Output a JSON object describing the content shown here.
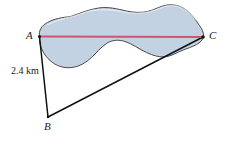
{
  "figure": {
    "type": "geometry-diagram",
    "vertices": [
      {
        "id": "A",
        "label": "A",
        "x": 39,
        "y": 36
      },
      {
        "id": "B",
        "label": "B",
        "x": 48,
        "y": 117
      },
      {
        "id": "C",
        "label": "C",
        "x": 203,
        "y": 37
      }
    ],
    "measurements": [
      {
        "side": "AB",
        "label": "2.4 km",
        "value": 2.4,
        "unit": "km"
      }
    ],
    "colors": {
      "lake_fill": "#c2d2e2",
      "lake_outline": "#4a4a48",
      "measure_line": "#d1546c",
      "triangle_stroke": "#111111",
      "background": "#ffffff",
      "text": "#1a1a1a"
    },
    "segments": [
      {
        "name": "AC",
        "from": "A",
        "to": "C",
        "color": "#d1546c",
        "style": "solid",
        "crosses": "lake"
      },
      {
        "name": "AB",
        "from": "A",
        "to": "B",
        "color": "#111111",
        "style": "solid"
      },
      {
        "name": "BC",
        "from": "B",
        "to": "C",
        "color": "#111111",
        "style": "solid"
      }
    ],
    "lake": {
      "name": "lake",
      "fill": "#c2d2e2",
      "path": "M 39.5 36.5 C 38.5 30.5 41.5 25.5 47.5 22.5 C 54.5 18.5 62.5 17.5 70.5 16.5 C 79.5 13.5 88.5 9.5 98.5 8.0 C 108.5 6.5 117.5 9.0 126.5 11.0 C 133.5 12.5 140.5 13.0 147.5 11.5 C 154.5 10.0 160.0 6.0 167.0 5.0 C 175.0 3.8 182.0 6.5 187.5 11.0 C 192.5 15.0 196.0 20.5 199.5 25.5 C 202.0 29.0 204.0 32.5 203.5 36.5 C 203.0 40.0 200.0 42.5 196.5 44.5 C 192.0 47.0 187.0 48.5 182.0 50.5 C 177.0 52.5 172.5 55.5 167.0 56.5 C 160.0 57.8 153.0 55.5 146.5 52.5 C 139.0 49.0 132.5 44.0 125.0 41.5 C 118.5 39.3 112.0 40.0 106.5 43.5 C 100.5 47.3 96.5 53.0 91.5 57.5 C 86.0 62.5 79.5 66.5 72.0 67.5 C 64.0 68.5 56.0 66.0 50.0 60.5 C 44.5 55.5 40.5 48.5 39.5 41.0 Z"
    }
  }
}
